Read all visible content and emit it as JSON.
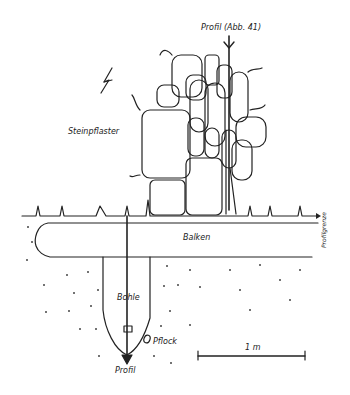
{
  "diagram": {
    "type": "archaeological plan drawing",
    "labels": {
      "profile_top": "Profil (Abb. 41)",
      "stone_pavement": "Steinpflaster",
      "beam": "Balken",
      "profile_boundary": "Profilgrenze",
      "plank": "Bohle",
      "peg": "Pflock",
      "profile_bottom": "Profil",
      "scale": "1 m"
    },
    "symbols": {
      "north_arrow": "north-arrow-icon"
    },
    "colors": {
      "ink": "#222222",
      "paper": "#ffffff"
    }
  }
}
